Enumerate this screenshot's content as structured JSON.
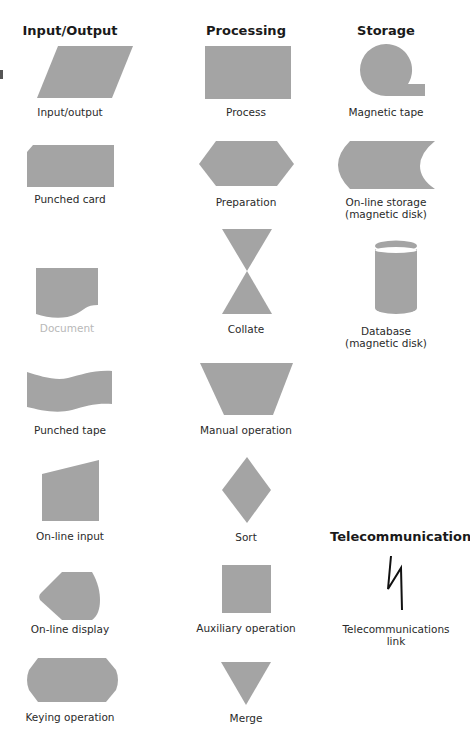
{
  "columns": {
    "input_output": {
      "header": "Input/Output"
    },
    "processing": {
      "header": "Processing"
    },
    "storage": {
      "header": "Storage"
    },
    "telecom": {
      "header": "Telecommunications"
    }
  },
  "colors": {
    "shape_fill": "#a4a4a4",
    "faded_label": "#b8b8b8",
    "text": "#2a2a2a"
  },
  "symbols": {
    "input_output": "Input/output",
    "punched_card": "Punched card",
    "document": "Document",
    "punched_tape": "Punched tape",
    "online_input": "On-line input",
    "online_display": "On-line display",
    "keying_operation": "Keying operation",
    "process": "Process",
    "preparation": "Preparation",
    "collate": "Collate",
    "manual_operation": "Manual operation",
    "sort": "Sort",
    "auxiliary_operation": "Auxiliary operation",
    "merge": "Merge",
    "magnetic_tape": "Magnetic tape",
    "online_storage_l1": "On-line storage",
    "online_storage_l2": "(magnetic disk)",
    "database_l1": "Database",
    "database_l2": "(magnetic disk)",
    "telecom_link_l1": "Telecommunications",
    "telecom_link_l2": "link"
  }
}
